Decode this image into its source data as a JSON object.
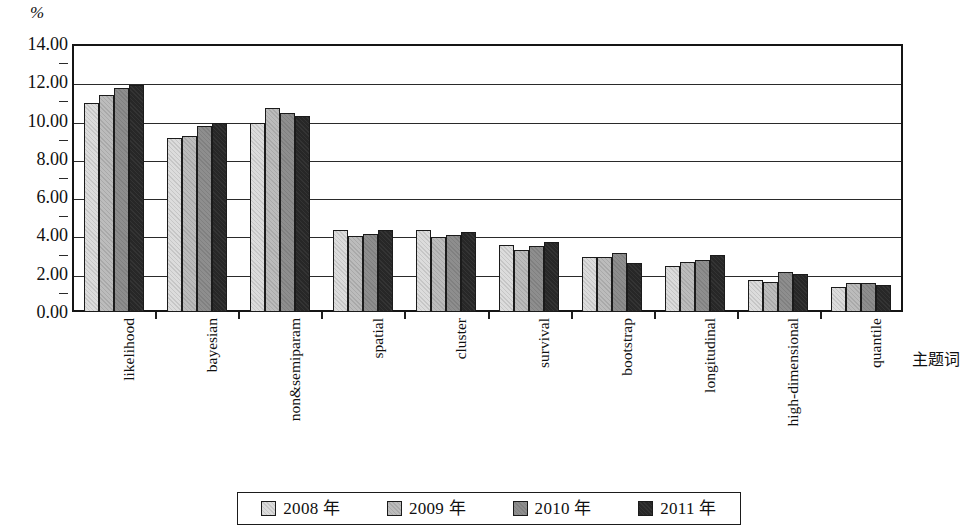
{
  "axes": {
    "y_unit": "%",
    "x_axis_name": "主题词",
    "y_ticks": [
      "14.00",
      "12.00",
      "10.00",
      "8.00",
      "6.00",
      "4.00",
      "2.00",
      "0.00"
    ]
  },
  "legend": {
    "items": [
      {
        "label": "2008 年",
        "color": "#dcdcdc"
      },
      {
        "label": "2009 年",
        "color": "#bcbcbc"
      },
      {
        "label": "2010 年",
        "color": "#8e8e8e"
      },
      {
        "label": "2011 年",
        "color": "#272727"
      }
    ]
  },
  "chart_data": {
    "type": "bar",
    "title": "",
    "xlabel": "主题词",
    "ylabel": "%",
    "ylim": [
      0,
      14
    ],
    "ytick_step": 2,
    "grid": true,
    "legend_position": "bottom",
    "categories": [
      "likelihood",
      "bayesian",
      "non&semiparam",
      "spatial",
      "cluster",
      "survival",
      "bootstrap",
      "longitudinal",
      "high-dimensional",
      "quantile"
    ],
    "series": [
      {
        "name": "2008 年",
        "color": "#dcdcdc",
        "values": [
          10.9,
          9.1,
          9.85,
          4.3,
          4.3,
          3.5,
          2.85,
          2.4,
          1.65,
          1.3
        ]
      },
      {
        "name": "2009 年",
        "color": "#bcbcbc",
        "values": [
          11.35,
          9.2,
          10.65,
          3.95,
          3.9,
          3.25,
          2.85,
          2.6,
          1.55,
          1.5
        ]
      },
      {
        "name": "2010 年",
        "color": "#8e8e8e",
        "values": [
          11.7,
          9.7,
          10.4,
          4.05,
          4.0,
          3.45,
          3.1,
          2.7,
          2.1,
          1.5
        ]
      },
      {
        "name": "2011 年",
        "color": "#272727",
        "values": [
          11.85,
          9.85,
          10.25,
          4.3,
          4.2,
          3.65,
          2.55,
          3.0,
          2.0,
          1.4
        ]
      }
    ]
  }
}
